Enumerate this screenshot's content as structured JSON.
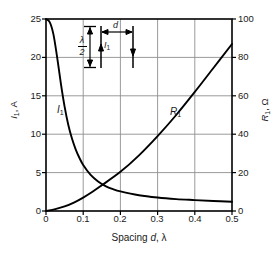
{
  "figure": {
    "kind": "engineering-plot",
    "background": "#ffffff",
    "ink_color": "#000000",
    "grid_color": "#9a9a9a"
  },
  "axes": {
    "x": {
      "label_prefix": "Spacing",
      "label_symbol": "d",
      "label_unit": "λ",
      "ticks": [
        "0",
        "0.1",
        "0.2",
        "0.3",
        "0.4",
        "0.5"
      ],
      "min": 0,
      "max": 0.5
    },
    "y_left": {
      "symbol": "I",
      "subscript": "1",
      "unit": "A",
      "ticks": [
        "0",
        "5",
        "10",
        "15",
        "20",
        "25"
      ],
      "min": 0,
      "max": 25
    },
    "y_right": {
      "symbol": "R",
      "subscript": "1",
      "unit": "Ω",
      "ticks": [
        "0",
        "20",
        "40",
        "60",
        "80",
        "100"
      ],
      "min": 0,
      "max": 100
    }
  },
  "curve_labels": {
    "current": {
      "symbol": "I",
      "subscript": "1"
    },
    "resistance": {
      "symbol": "R",
      "subscript": "1"
    }
  },
  "inset": {
    "spacing_symbol": "d",
    "length_numerator": "λ",
    "length_denominator": "2",
    "current_symbol": "I",
    "current_subscript": "1"
  },
  "chart_data": {
    "type": "line",
    "title": "",
    "xlabel": "Spacing d, λ",
    "ylabel": "I₁, A",
    "ylabel_right": "R₁, Ω",
    "xlim": [
      0,
      0.5
    ],
    "ylim": [
      0,
      25
    ],
    "ylim_right": [
      0,
      100
    ],
    "grid": true,
    "legend": "inline-annotations",
    "xticks": [
      0,
      0.1,
      0.2,
      0.3,
      0.4,
      0.5
    ],
    "yticks_left": [
      0,
      5,
      10,
      15,
      20,
      25
    ],
    "yticks_right": [
      0,
      20,
      40,
      60,
      80,
      100
    ],
    "series": [
      {
        "name": "I₁",
        "axis": "left",
        "unit": "A",
        "x": [
          0.0,
          0.01,
          0.02,
          0.03,
          0.04,
          0.05,
          0.06,
          0.07,
          0.08,
          0.09,
          0.1,
          0.12,
          0.14,
          0.16,
          0.18,
          0.2,
          0.25,
          0.3,
          0.35,
          0.4,
          0.45,
          0.5
        ],
        "values": [
          25.0,
          24.6,
          23.0,
          20.0,
          16.6,
          13.6,
          11.2,
          9.4,
          8.0,
          6.9,
          6.0,
          4.7,
          3.85,
          3.25,
          2.85,
          2.55,
          2.05,
          1.75,
          1.55,
          1.42,
          1.3,
          1.2
        ]
      },
      {
        "name": "R₁",
        "axis": "right",
        "unit": "Ω",
        "x": [
          0.0,
          0.025,
          0.05,
          0.075,
          0.1,
          0.125,
          0.15,
          0.2,
          0.25,
          0.3,
          0.35,
          0.4,
          0.45,
          0.5
        ],
        "values": [
          0.0,
          1.0,
          2.4,
          4.4,
          7.0,
          10.0,
          13.4,
          20.4,
          29.0,
          39.0,
          50.0,
          62.0,
          74.5,
          87.0
        ]
      }
    ],
    "annotations": [
      {
        "text": "I₁",
        "x": 0.04,
        "y_left": 12.2
      },
      {
        "text": "R₁",
        "x": 0.335,
        "y_right": 52
      }
    ]
  }
}
